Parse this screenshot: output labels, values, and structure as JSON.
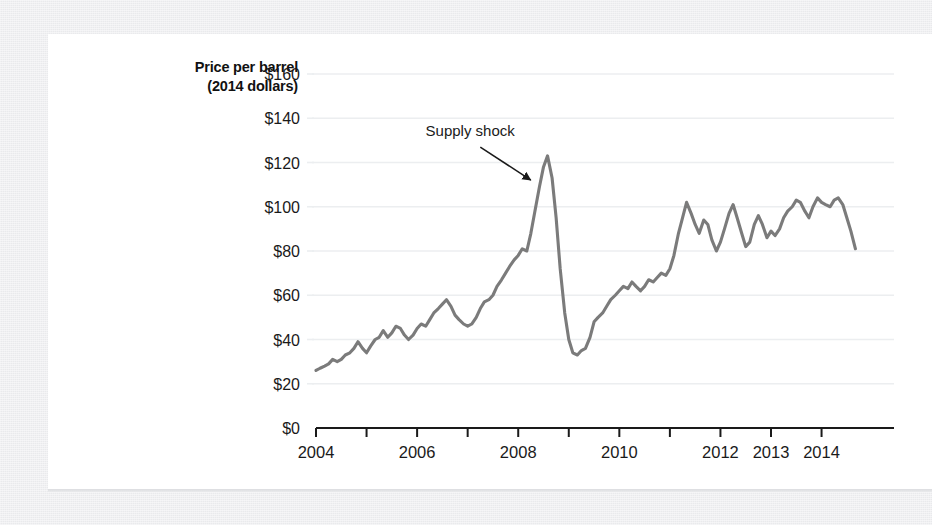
{
  "figure": {
    "axis_label": {
      "line1": "Price per barrel",
      "line2": "(2014 dollars)"
    },
    "annotation_label": "Supply shock",
    "colors": {
      "line": "#7b7b7b",
      "grid": "#eceef0",
      "axis": "#1a1a1a",
      "text": "#1a1a1a",
      "card": "#ffffff",
      "background": "#e9eaec"
    }
  },
  "chart_data": {
    "type": "line",
    "title": "",
    "xlabel": "",
    "ylabel": "Price per barrel (2014 dollars)",
    "xlim": [
      2004.0,
      2014.8
    ],
    "ylim": [
      0,
      160
    ],
    "grid": true,
    "legend": null,
    "ytick_labels": [
      "$0",
      "$20",
      "$40",
      "$60",
      "$80",
      "$100",
      "$120",
      "$140",
      "$160"
    ],
    "ytick_values": [
      0,
      20,
      40,
      60,
      80,
      100,
      120,
      140,
      160
    ],
    "xtick_values": [
      2004,
      2005,
      2006,
      2007,
      2008,
      2009,
      2010,
      2011,
      2012,
      2013,
      2014
    ],
    "xtick_labels": [
      "2004",
      "",
      "2006",
      "",
      "2008",
      "",
      "2010",
      "",
      "2012",
      "2013",
      "2014"
    ],
    "annotations": [
      {
        "text": "Supply shock",
        "text_x": 2007.05,
        "text_y": 132,
        "arrow_from_x": 2007.25,
        "arrow_from_y": 127,
        "arrow_to_x": 2008.25,
        "arrow_to_y": 112
      }
    ],
    "series": [
      {
        "name": "Crude oil price per barrel (2014 dollars)",
        "x": [
          2004.0,
          2004.08,
          2004.17,
          2004.25,
          2004.33,
          2004.42,
          2004.5,
          2004.58,
          2004.67,
          2004.75,
          2004.83,
          2004.92,
          2005.0,
          2005.08,
          2005.17,
          2005.25,
          2005.33,
          2005.42,
          2005.5,
          2005.58,
          2005.67,
          2005.75,
          2005.83,
          2005.92,
          2006.0,
          2006.08,
          2006.17,
          2006.25,
          2006.33,
          2006.42,
          2006.5,
          2006.58,
          2006.67,
          2006.75,
          2006.83,
          2006.92,
          2007.0,
          2007.08,
          2007.17,
          2007.25,
          2007.33,
          2007.42,
          2007.5,
          2007.58,
          2007.67,
          2007.75,
          2007.83,
          2007.92,
          2008.0,
          2008.08,
          2008.17,
          2008.25,
          2008.33,
          2008.42,
          2008.5,
          2008.58,
          2008.67,
          2008.75,
          2008.83,
          2008.92,
          2009.0,
          2009.08,
          2009.17,
          2009.25,
          2009.33,
          2009.42,
          2009.5,
          2009.58,
          2009.67,
          2009.75,
          2009.83,
          2009.92,
          2010.0,
          2010.08,
          2010.17,
          2010.25,
          2010.33,
          2010.42,
          2010.5,
          2010.58,
          2010.67,
          2010.75,
          2010.83,
          2010.92,
          2011.0,
          2011.08,
          2011.17,
          2011.25,
          2011.33,
          2011.42,
          2011.5,
          2011.58,
          2011.67,
          2011.75,
          2011.83,
          2011.92,
          2012.0,
          2012.08,
          2012.17,
          2012.25,
          2012.33,
          2012.42,
          2012.5,
          2012.58,
          2012.67,
          2012.75,
          2012.83,
          2012.92,
          2013.0,
          2013.08,
          2013.17,
          2013.25,
          2013.33,
          2013.42,
          2013.5,
          2013.58,
          2013.67,
          2013.75,
          2013.83,
          2013.92,
          2014.0,
          2014.08,
          2014.17,
          2014.25,
          2014.33,
          2014.42,
          2014.5,
          2014.58,
          2014.67
        ],
        "y": [
          26,
          27,
          28,
          29,
          31,
          30,
          31,
          33,
          34,
          36,
          39,
          36,
          34,
          37,
          40,
          41,
          44,
          41,
          43,
          46,
          45,
          42,
          40,
          42,
          45,
          47,
          46,
          49,
          52,
          54,
          56,
          58,
          55,
          51,
          49,
          47,
          46,
          47,
          50,
          54,
          57,
          58,
          60,
          64,
          67,
          70,
          73,
          76,
          78,
          81,
          80,
          88,
          98,
          109,
          118,
          123,
          113,
          95,
          72,
          52,
          40,
          34,
          33,
          35,
          36,
          41,
          48,
          50,
          52,
          55,
          58,
          60,
          62,
          64,
          63,
          66,
          64,
          62,
          64,
          67,
          66,
          68,
          70,
          69,
          72,
          78,
          88,
          95,
          102,
          97,
          92,
          88,
          94,
          92,
          85,
          80,
          84,
          90,
          97,
          101,
          95,
          88,
          82,
          84,
          92,
          96,
          92,
          86,
          89,
          87,
          90,
          95,
          98,
          100,
          103,
          102,
          98,
          95,
          100,
          104,
          102,
          101,
          100,
          103,
          104,
          101,
          95,
          89,
          81
        ]
      }
    ]
  }
}
